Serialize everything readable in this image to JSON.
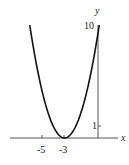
{
  "chart_data": {
    "type": "line",
    "title": "",
    "function": "y = (x + 3)^2",
    "xlabel": "x",
    "ylabel": "y",
    "xlim": [
      -8,
      2
    ],
    "ylim": [
      0,
      10
    ],
    "grid": false,
    "legend": null,
    "x_ticks": [
      {
        "value": -5,
        "label": "-5"
      },
      {
        "value": -3,
        "label": "-3"
      }
    ],
    "y_ticks": [
      {
        "value": 1,
        "label": "1"
      },
      {
        "value": 10,
        "label": "10"
      }
    ],
    "series": [
      {
        "name": "parabola",
        "x": [
          -6.16,
          -6,
          -5.5,
          -5,
          -4.5,
          -4,
          -3.5,
          -3,
          -2.5,
          -2,
          -1.5,
          -1,
          -0.5,
          0,
          0.16
        ],
        "y": [
          9.99,
          9,
          6.25,
          4,
          2.25,
          1,
          0.25,
          0,
          0.25,
          1,
          2.25,
          4,
          6.25,
          9,
          9.99
        ]
      }
    ],
    "annotations": []
  },
  "colors": {
    "axis": "#444444",
    "curve": "#111111",
    "text": "#222222"
  }
}
